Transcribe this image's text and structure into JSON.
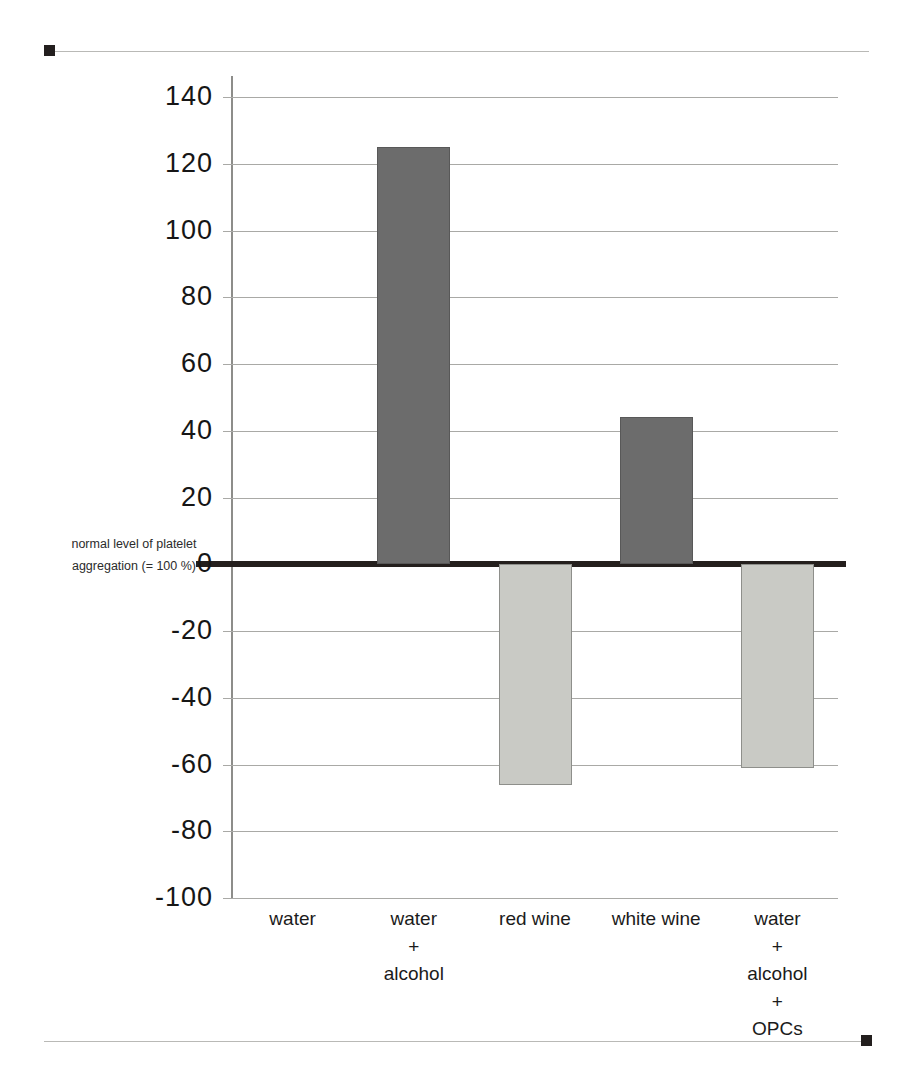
{
  "chart_data": {
    "type": "bar",
    "title": "",
    "subtitle": "",
    "xlabel": "",
    "ylabel": "",
    "categories": [
      "water",
      "water\n+\nalcohol",
      "red wine",
      "white wine",
      "water\n+\nalcohol\n+\nOPCs"
    ],
    "category_lines": [
      [
        "water"
      ],
      [
        "water",
        "+",
        "alcohol"
      ],
      [
        "red wine"
      ],
      [
        "white wine"
      ],
      [
        "water",
        "+",
        "alcohol",
        "+",
        "OPCs"
      ]
    ],
    "values": [
      0,
      125,
      -66,
      44,
      -61
    ],
    "bar_styles": [
      "none",
      "dark",
      "light",
      "dark",
      "light"
    ],
    "ylim": [
      -100,
      140
    ],
    "yticks": [
      140,
      120,
      100,
      80,
      60,
      40,
      20,
      0,
      -20,
      -40,
      -60,
      -80,
      -100
    ],
    "ytick_labels": [
      "140",
      "120",
      "100",
      "80",
      "60",
      "40",
      "20",
      "0",
      "-20",
      "-40",
      "-60",
      "-80",
      "-100"
    ],
    "grid": true,
    "legend": "none",
    "annotations": [
      {
        "name": "zero-baseline-note",
        "lines": [
          "normal level of platelet",
          "aggregation (= 100 %)"
        ],
        "value": 0
      }
    ]
  },
  "colors": {
    "bar_dark": "#6c6c6c",
    "bar_dark_border": "#585858",
    "bar_light": "#c9cac5",
    "bar_light_border": "#8e8f8b",
    "gridline": "#a9a9a6",
    "axis": "#8d8d8a",
    "zero_line": "#241f1d",
    "page_rule": "#b9b9b6",
    "cap": "#231f1e",
    "text": "#161616",
    "background": "#ffffff"
  }
}
